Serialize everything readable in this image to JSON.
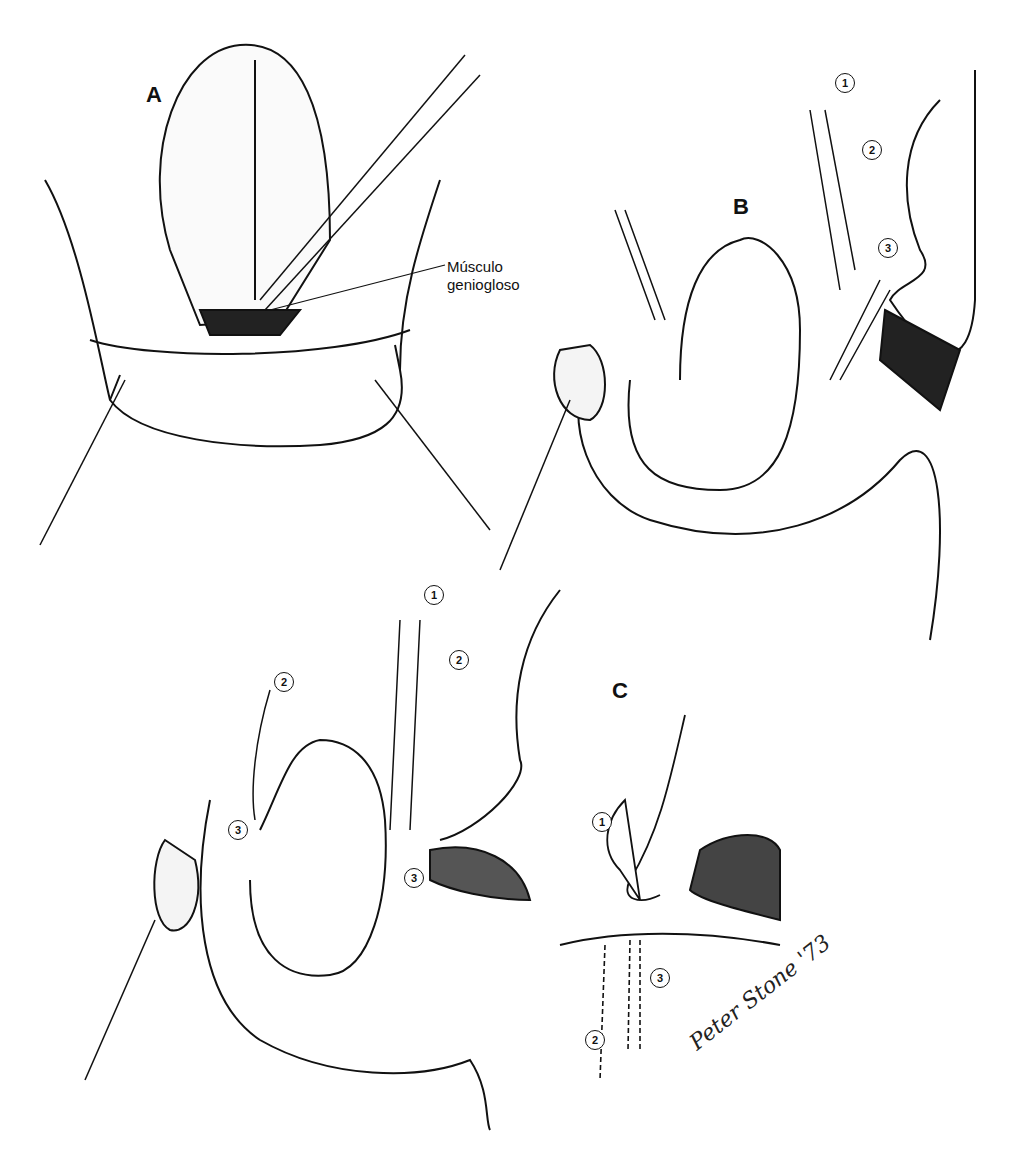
{
  "figure": {
    "panels": [
      {
        "id": "A",
        "label": "A",
        "annotation": "Músculo geniogloso"
      },
      {
        "id": "B",
        "label": "B",
        "suture_markers": [
          "1",
          "2",
          "3"
        ]
      },
      {
        "id": "B2",
        "label": "",
        "suture_markers": [
          "1",
          "2",
          "2",
          "3",
          "3"
        ]
      },
      {
        "id": "C",
        "label": "C",
        "suture_markers": [
          "1",
          "2",
          "3"
        ]
      }
    ],
    "annotation_line1": "Músculo",
    "annotation_line2": "geniogloso",
    "signature": "Peter Stone '73"
  }
}
